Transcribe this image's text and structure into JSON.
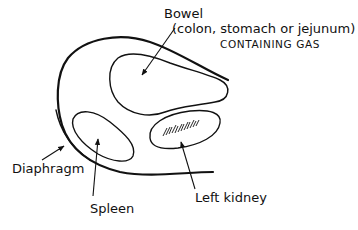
{
  "figure": {
    "type": "anatomical line drawing",
    "colors": {
      "stroke": "#111111",
      "background": "#ffffff"
    },
    "labels": {
      "bowel": "Bowel",
      "bowel_detail": "(colon, stomach or jejunum)",
      "bowel_note": "CONTAINING GAS",
      "diaphragm": "Diaphragm",
      "spleen": "Spleen",
      "left_kidney": "Left kidney"
    }
  }
}
